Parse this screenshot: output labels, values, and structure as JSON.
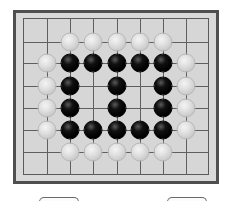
{
  "game": {
    "type": "go-board",
    "board": {
      "columns_x": [
        23,
        47,
        70,
        93,
        117,
        140,
        163,
        186,
        209
      ],
      "rows_y": [
        18,
        42,
        63,
        86,
        108,
        130,
        152,
        175
      ],
      "colors": {
        "frame_border": "#4f4f4f",
        "frame_fill": "#d9d9d9",
        "board_fill": "#d6d6d6",
        "grid_line": "#5f5f5f"
      }
    },
    "stones": [
      {
        "color": "white",
        "col": 2,
        "row": 1
      },
      {
        "color": "white",
        "col": 3,
        "row": 1
      },
      {
        "color": "white",
        "col": 4,
        "row": 1
      },
      {
        "color": "white",
        "col": 5,
        "row": 1
      },
      {
        "color": "white",
        "col": 6,
        "row": 1
      },
      {
        "color": "white",
        "col": 1,
        "row": 2
      },
      {
        "color": "black",
        "col": 2,
        "row": 2
      },
      {
        "color": "black",
        "col": 3,
        "row": 2
      },
      {
        "color": "black",
        "col": 4,
        "row": 2
      },
      {
        "color": "black",
        "col": 5,
        "row": 2
      },
      {
        "color": "black",
        "col": 6,
        "row": 2
      },
      {
        "color": "white",
        "col": 7,
        "row": 2
      },
      {
        "color": "white",
        "col": 1,
        "row": 3
      },
      {
        "color": "black",
        "col": 2,
        "row": 3
      },
      {
        "color": "black",
        "col": 4,
        "row": 3
      },
      {
        "color": "black",
        "col": 6,
        "row": 3
      },
      {
        "color": "white",
        "col": 7,
        "row": 3
      },
      {
        "color": "white",
        "col": 1,
        "row": 4
      },
      {
        "color": "black",
        "col": 2,
        "row": 4
      },
      {
        "color": "black",
        "col": 4,
        "row": 4
      },
      {
        "color": "black",
        "col": 6,
        "row": 4
      },
      {
        "color": "white",
        "col": 7,
        "row": 4
      },
      {
        "color": "white",
        "col": 1,
        "row": 5
      },
      {
        "color": "black",
        "col": 2,
        "row": 5
      },
      {
        "color": "black",
        "col": 3,
        "row": 5
      },
      {
        "color": "black",
        "col": 4,
        "row": 5
      },
      {
        "color": "black",
        "col": 5,
        "row": 5
      },
      {
        "color": "black",
        "col": 6,
        "row": 5
      },
      {
        "color": "white",
        "col": 7,
        "row": 5
      },
      {
        "color": "white",
        "col": 2,
        "row": 6
      },
      {
        "color": "white",
        "col": 3,
        "row": 6
      },
      {
        "color": "white",
        "col": 4,
        "row": 6
      },
      {
        "color": "white",
        "col": 5,
        "row": 6
      },
      {
        "color": "white",
        "col": 6,
        "row": 6
      }
    ]
  },
  "buttons": [
    {
      "label": "",
      "left": 39,
      "width": 40
    },
    {
      "label": "",
      "left": 167,
      "width": 40
    }
  ]
}
